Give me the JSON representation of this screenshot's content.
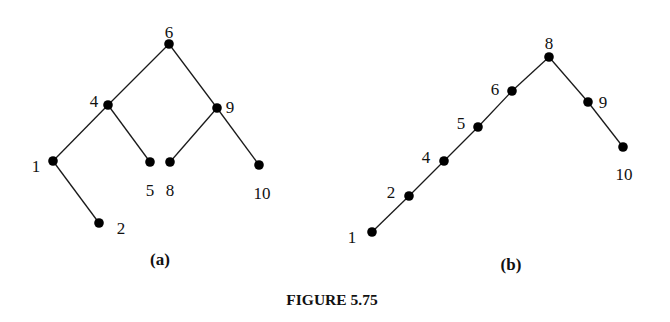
{
  "figure": {
    "caption": "FIGURE 5.75",
    "trees": [
      {
        "id": "a",
        "label": "(a)",
        "root": "6",
        "nodes": [
          {
            "id": "6",
            "x": 169,
            "y": 44,
            "lx": 169,
            "ly": 33,
            "anchor": "middle"
          },
          {
            "id": "4",
            "x": 108,
            "y": 105,
            "lx": 94,
            "ly": 102,
            "anchor": "middle"
          },
          {
            "id": "9",
            "x": 217,
            "y": 108,
            "lx": 230,
            "ly": 108,
            "anchor": "middle"
          },
          {
            "id": "1",
            "x": 53,
            "y": 161,
            "lx": 36,
            "ly": 167,
            "anchor": "middle"
          },
          {
            "id": "5",
            "x": 150,
            "y": 162,
            "lx": 150,
            "ly": 191,
            "anchor": "middle"
          },
          {
            "id": "8",
            "x": 170,
            "y": 162,
            "lx": 170,
            "ly": 191,
            "anchor": "middle"
          },
          {
            "id": "10",
            "x": 259,
            "y": 165,
            "lx": 262,
            "ly": 194,
            "anchor": "middle"
          },
          {
            "id": "2",
            "x": 99,
            "y": 223,
            "lx": 121,
            "ly": 229,
            "anchor": "middle"
          }
        ],
        "edges": [
          [
            "6",
            "4"
          ],
          [
            "6",
            "9"
          ],
          [
            "4",
            "1"
          ],
          [
            "4",
            "5"
          ],
          [
            "1",
            "2"
          ],
          [
            "9",
            "8"
          ],
          [
            "9",
            "10"
          ]
        ],
        "label_pos": {
          "x": 160,
          "y": 265
        }
      },
      {
        "id": "b",
        "label": "(b)",
        "root": "8",
        "nodes": [
          {
            "id": "8",
            "x": 549,
            "y": 57,
            "lx": 549,
            "ly": 44,
            "anchor": "middle"
          },
          {
            "id": "6",
            "x": 512,
            "y": 91,
            "lx": 495,
            "ly": 90,
            "anchor": "middle"
          },
          {
            "id": "5",
            "x": 478,
            "y": 127,
            "lx": 461,
            "ly": 124,
            "anchor": "middle"
          },
          {
            "id": "4",
            "x": 444,
            "y": 161,
            "lx": 426,
            "ly": 158,
            "anchor": "middle"
          },
          {
            "id": "2",
            "x": 409,
            "y": 196,
            "lx": 391,
            "ly": 193,
            "anchor": "middle"
          },
          {
            "id": "1",
            "x": 372,
            "y": 232,
            "lx": 352,
            "ly": 238,
            "anchor": "middle"
          },
          {
            "id": "9",
            "x": 588,
            "y": 102,
            "lx": 603,
            "ly": 103,
            "anchor": "middle"
          },
          {
            "id": "10",
            "x": 623,
            "y": 147,
            "lx": 624,
            "ly": 175,
            "anchor": "middle"
          }
        ],
        "edges": [
          [
            "8",
            "6"
          ],
          [
            "6",
            "5"
          ],
          [
            "5",
            "4"
          ],
          [
            "4",
            "2"
          ],
          [
            "2",
            "1"
          ],
          [
            "8",
            "9"
          ],
          [
            "9",
            "10"
          ]
        ],
        "label_pos": {
          "x": 511,
          "y": 270
        }
      }
    ],
    "caption_pos": {
      "x": 332,
      "y": 305
    }
  }
}
